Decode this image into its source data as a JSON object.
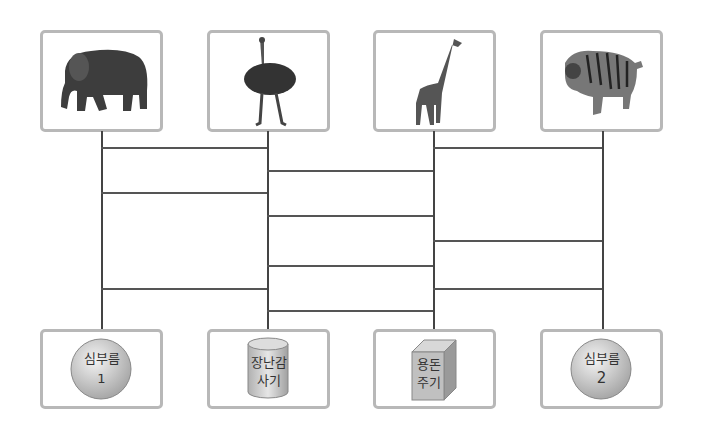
{
  "top_items": [
    {
      "animal": "elephant",
      "x": 40
    },
    {
      "animal": "ostrich",
      "x": 207
    },
    {
      "animal": "giraffe",
      "x": 373
    },
    {
      "animal": "tiger",
      "x": 540
    }
  ],
  "bottom_items": [
    {
      "shape": "sphere",
      "line1": "심부름",
      "line2": "1"
    },
    {
      "shape": "cylinder",
      "line1": "장난감",
      "line2": "사기"
    },
    {
      "shape": "cube",
      "line1": "용돈",
      "line2": "주기"
    },
    {
      "shape": "sphere",
      "line1": "심부름",
      "line2": "2"
    }
  ],
  "ladder": {
    "columns_x": [
      101,
      267,
      433,
      602
    ],
    "rungs": [
      {
        "from": 0,
        "to": 1,
        "y": 147
      },
      {
        "from": 0,
        "to": 1,
        "y": 192
      },
      {
        "from": 0,
        "to": 1,
        "y": 288
      },
      {
        "from": 1,
        "to": 2,
        "y": 170
      },
      {
        "from": 1,
        "to": 2,
        "y": 215
      },
      {
        "from": 1,
        "to": 2,
        "y": 265
      },
      {
        "from": 1,
        "to": 2,
        "y": 310
      },
      {
        "from": 2,
        "to": 3,
        "y": 147
      },
      {
        "from": 2,
        "to": 3,
        "y": 240
      },
      {
        "from": 2,
        "to": 3,
        "y": 288
      }
    ]
  },
  "colors": {
    "box_border": "#b8b8b8",
    "line": "#444444",
    "shape_fill": "#c8c8c8"
  }
}
